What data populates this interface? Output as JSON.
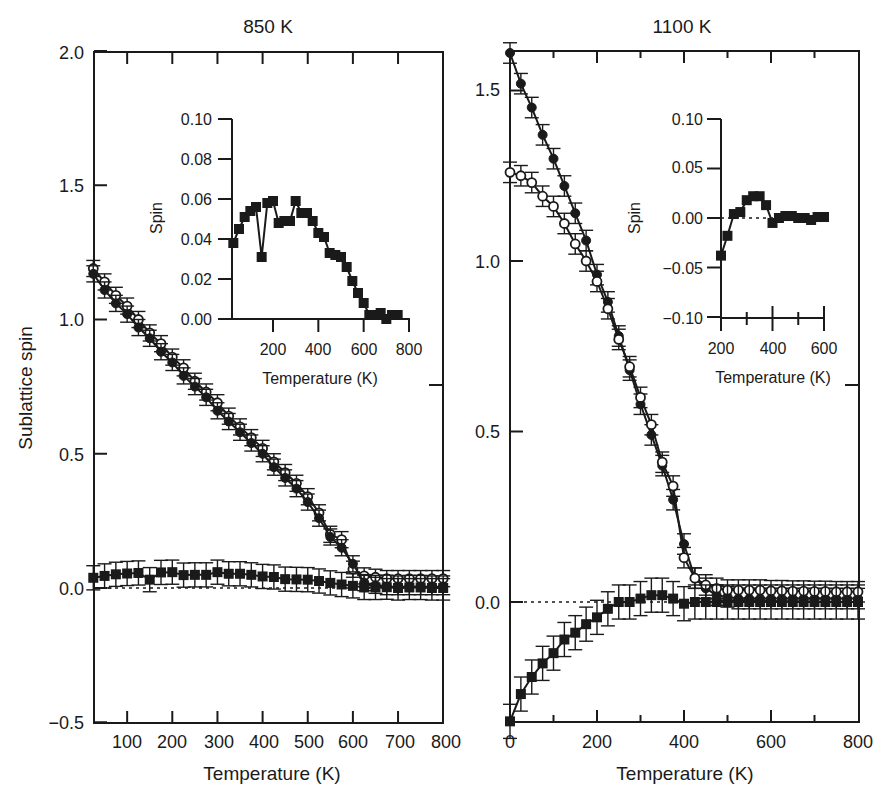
{
  "figure": {
    "panels": [
      {
        "title": "850 K",
        "xlabel": "Temperature (K)",
        "ylabel": "Sublattice spin",
        "xticks": [
          "100",
          "200",
          "300",
          "400",
          "500",
          "600",
          "700",
          "800"
        ],
        "yticks": [
          "−0.5",
          "0.0",
          "0.5",
          "1.0",
          "1.5",
          "2.0"
        ],
        "inset": {
          "ylabel": "Spin",
          "xlabel": "Temperature (K)",
          "xticks": [
            "200",
            "400",
            "600",
            "800"
          ],
          "yticks": [
            "0.00",
            "0.02",
            "0.04",
            "0.06",
            "0.08",
            "0.10"
          ]
        }
      },
      {
        "title": "1100 K",
        "xlabel": "Temperature (K)",
        "ylabel": "",
        "xticks": [
          "0",
          "200",
          "400",
          "600",
          "800"
        ],
        "yticks": [
          "0.0",
          "0.5",
          "1.0",
          "1.5"
        ],
        "inset": {
          "ylabel": "Spin",
          "xlabel": "Temperature (K)",
          "xticks": [
            "200",
            "400",
            "600"
          ],
          "yticks": [
            "−0.10",
            "−0.05",
            "0.00",
            "0.05",
            "0.10"
          ]
        }
      }
    ]
  },
  "chart_data": [
    {
      "type": "line",
      "title": "850 K",
      "xlabel": "Temperature (K)",
      "ylabel": "Sublattice spin",
      "xlim": [
        25,
        800
      ],
      "ylim": [
        -0.5,
        2.0
      ],
      "xticks": [
        100,
        200,
        300,
        400,
        500,
        600,
        700,
        800
      ],
      "yticks": [
        -0.5,
        0.0,
        0.5,
        1.0,
        1.5,
        2.0
      ],
      "grid": false,
      "reference_line": {
        "y": 0.0,
        "style": "dotted"
      },
      "x": [
        25,
        50,
        75,
        100,
        125,
        150,
        175,
        200,
        225,
        250,
        275,
        300,
        325,
        350,
        375,
        400,
        425,
        450,
        475,
        500,
        525,
        550,
        575,
        600,
        625,
        650,
        675,
        700,
        725,
        750,
        775,
        800
      ],
      "series": [
        {
          "name": "open circles",
          "marker": "open-circle",
          "error": 0.03,
          "values": [
            1.19,
            1.14,
            1.09,
            1.05,
            1.0,
            0.95,
            0.91,
            0.86,
            0.82,
            0.77,
            0.73,
            0.69,
            0.64,
            0.6,
            0.56,
            0.52,
            0.47,
            0.43,
            0.39,
            0.34,
            0.28,
            0.2,
            0.18,
            0.07,
            0.045,
            0.04,
            0.035,
            0.035,
            0.035,
            0.035,
            0.035,
            0.035
          ]
        },
        {
          "name": "filled circles",
          "marker": "filled-circle",
          "error": 0.03,
          "values": [
            1.17,
            1.11,
            1.06,
            1.02,
            0.97,
            0.93,
            0.88,
            0.84,
            0.79,
            0.75,
            0.71,
            0.66,
            0.62,
            0.58,
            0.54,
            0.5,
            0.45,
            0.41,
            0.37,
            0.32,
            0.26,
            0.19,
            0.15,
            0.09,
            0.02,
            0.01,
            0.005,
            0.005,
            0.005,
            0.005,
            0.005,
            0.005
          ]
        },
        {
          "name": "filled squares",
          "marker": "filled-square",
          "error": 0.045,
          "values": [
            0.038,
            0.045,
            0.051,
            0.054,
            0.056,
            0.031,
            0.058,
            0.059,
            0.048,
            0.049,
            0.049,
            0.059,
            0.053,
            0.053,
            0.049,
            0.043,
            0.041,
            0.033,
            0.032,
            0.031,
            0.026,
            0.019,
            0.013,
            0.008,
            0.002,
            0.002,
            0.003,
            0.0,
            0.002,
            0.002,
            0.0,
            0.0
          ]
        }
      ],
      "inset": {
        "type": "line",
        "xlabel": "Temperature (K)",
        "ylabel": "Spin",
        "xlim": [
          25,
          800
        ],
        "ylim": [
          0.0,
          0.1
        ],
        "xticks": [
          200,
          400,
          600,
          800
        ],
        "yticks": [
          0.0,
          0.02,
          0.04,
          0.06,
          0.08,
          0.1
        ],
        "x": [
          25,
          50,
          75,
          100,
          125,
          150,
          175,
          200,
          225,
          250,
          275,
          300,
          325,
          350,
          375,
          400,
          425,
          450,
          475,
          500,
          525,
          550,
          575,
          600,
          625,
          650,
          675,
          700,
          725,
          750
        ],
        "values": [
          0.038,
          0.045,
          0.051,
          0.054,
          0.056,
          0.031,
          0.058,
          0.059,
          0.048,
          0.049,
          0.049,
          0.059,
          0.053,
          0.053,
          0.049,
          0.043,
          0.041,
          0.033,
          0.032,
          0.031,
          0.026,
          0.019,
          0.013,
          0.008,
          0.002,
          0.002,
          0.003,
          0.0,
          0.002,
          0.002
        ]
      }
    },
    {
      "type": "line",
      "title": "1100 K",
      "xlabel": "Temperature (K)",
      "ylabel": "Sublattice spin",
      "xlim": [
        0,
        800
      ],
      "ylim": [
        -0.35,
        1.61
      ],
      "xticks": [
        0,
        200,
        400,
        600,
        800
      ],
      "yticks": [
        0.0,
        0.5,
        1.0,
        1.5
      ],
      "grid": false,
      "reference_line": {
        "y": 0.0,
        "style": "dotted"
      },
      "x": [
        0,
        25,
        50,
        75,
        100,
        125,
        150,
        175,
        200,
        225,
        250,
        275,
        300,
        325,
        350,
        375,
        400,
        425,
        450,
        475,
        500,
        525,
        550,
        575,
        600,
        625,
        650,
        675,
        700,
        725,
        750,
        775,
        800
      ],
      "series": [
        {
          "name": "filled circles",
          "marker": "filled-circle",
          "error": 0.03,
          "values": [
            1.61,
            1.52,
            1.45,
            1.37,
            1.3,
            1.22,
            1.14,
            1.06,
            0.96,
            0.88,
            0.78,
            0.68,
            0.58,
            0.49,
            0.4,
            0.3,
            0.17,
            0.07,
            0.04,
            0.02,
            0.015,
            0.01,
            0.01,
            0.01,
            0.01,
            0.01,
            0.01,
            0.01,
            0.01,
            0.01,
            0.01,
            0.01,
            0.01
          ]
        },
        {
          "name": "open circles",
          "marker": "open-circle",
          "error": 0.03,
          "values": [
            1.26,
            1.25,
            1.23,
            1.19,
            1.16,
            1.11,
            1.05,
            1.0,
            0.94,
            0.86,
            0.77,
            0.69,
            0.6,
            0.52,
            0.41,
            0.34,
            0.13,
            0.07,
            0.05,
            0.04,
            0.035,
            0.035,
            0.035,
            0.035,
            0.033,
            0.033,
            0.032,
            0.032,
            0.031,
            0.031,
            0.03,
            0.03,
            0.03
          ]
        },
        {
          "name": "filled squares",
          "marker": "filled-square",
          "error": 0.05,
          "values": [
            -0.35,
            -0.27,
            -0.22,
            -0.18,
            -0.15,
            -0.11,
            -0.09,
            -0.065,
            -0.045,
            -0.02,
            0.0,
            0.0,
            0.01,
            0.02,
            0.02,
            0.01,
            -0.005,
            0.0,
            0.0,
            0.0,
            0.0,
            0.0,
            0.0,
            0.0,
            0.0,
            0.0,
            0.0,
            0.0,
            0.0,
            0.0,
            0.0,
            0.0,
            0.0
          ]
        }
      ],
      "inset": {
        "type": "line",
        "xlabel": "Temperature (K)",
        "ylabel": "Spin",
        "xlim": [
          200,
          600
        ],
        "ylim": [
          -0.1,
          0.1
        ],
        "xticks": [
          200,
          400,
          600
        ],
        "yticks": [
          -0.1,
          -0.05,
          0.0,
          0.05,
          0.1
        ],
        "reference_line": {
          "y": 0.0,
          "style": "dotted"
        },
        "x": [
          200,
          225,
          250,
          275,
          300,
          325,
          350,
          375,
          400,
          425,
          450,
          475,
          500,
          525,
          550,
          575,
          600
        ],
        "values": [
          -0.038,
          -0.018,
          0.004,
          0.006,
          0.018,
          0.022,
          0.022,
          0.013,
          -0.005,
          0.0,
          0.002,
          0.002,
          0.0,
          0.0,
          -0.002,
          0.001,
          0.001
        ]
      }
    }
  ]
}
